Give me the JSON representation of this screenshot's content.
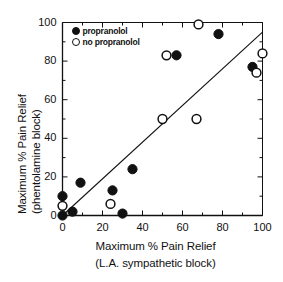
{
  "chart_data": {
    "type": "scatter",
    "title": "",
    "xlabel": "Maximum % Pain Relief (L.A. sympathetic block)",
    "xlabel_line1": "Maximum % Pain Relief",
    "xlabel_line2": "(L.A. sympathetic block)",
    "ylabel": "Maximum % Pain Relief (phentolamine block)",
    "ylabel_line1": "Maximum % Pain Relief",
    "ylabel_line2": "(phentolamine block)",
    "xlim": [
      0,
      100
    ],
    "ylim": [
      0,
      100
    ],
    "xticks": [
      0,
      20,
      40,
      60,
      80,
      100
    ],
    "yticks": [
      0,
      20,
      40,
      60,
      80,
      100
    ],
    "xtick_labels": [
      "0",
      "20",
      "40",
      "60",
      "80",
      "100"
    ],
    "ytick_labels": [
      "0",
      "20",
      "40",
      "60",
      "80",
      "100"
    ],
    "grid": false,
    "legend_position": "top-left",
    "marker_color": "#111111",
    "line_color": "#111111",
    "series": [
      {
        "name": "propranolol",
        "marker": "filled-circle",
        "points": [
          {
            "x": 0,
            "y": 10
          },
          {
            "x": 0,
            "y": 0
          },
          {
            "x": 5,
            "y": 2
          },
          {
            "x": 9,
            "y": 17
          },
          {
            "x": 25,
            "y": 13
          },
          {
            "x": 30,
            "y": 1
          },
          {
            "x": 35,
            "y": 24
          },
          {
            "x": 57,
            "y": 83
          },
          {
            "x": 78,
            "y": 94
          },
          {
            "x": 95,
            "y": 77
          }
        ]
      },
      {
        "name": "no propranolol",
        "marker": "open-circle",
        "points": [
          {
            "x": 0,
            "y": 5
          },
          {
            "x": 24,
            "y": 6
          },
          {
            "x": 50,
            "y": 50
          },
          {
            "x": 52,
            "y": 83
          },
          {
            "x": 67,
            "y": 50
          },
          {
            "x": 68,
            "y": 99
          },
          {
            "x": 97,
            "y": 74
          },
          {
            "x": 100,
            "y": 84
          }
        ]
      }
    ],
    "regression_line": {
      "name": "fit-line",
      "x0": 0,
      "y0": 0,
      "x1": 100,
      "y1": 95
    },
    "legend": [
      {
        "label": "propranolol",
        "marker": "filled-circle"
      },
      {
        "label": "no propranolol",
        "marker": "open-circle"
      }
    ]
  }
}
